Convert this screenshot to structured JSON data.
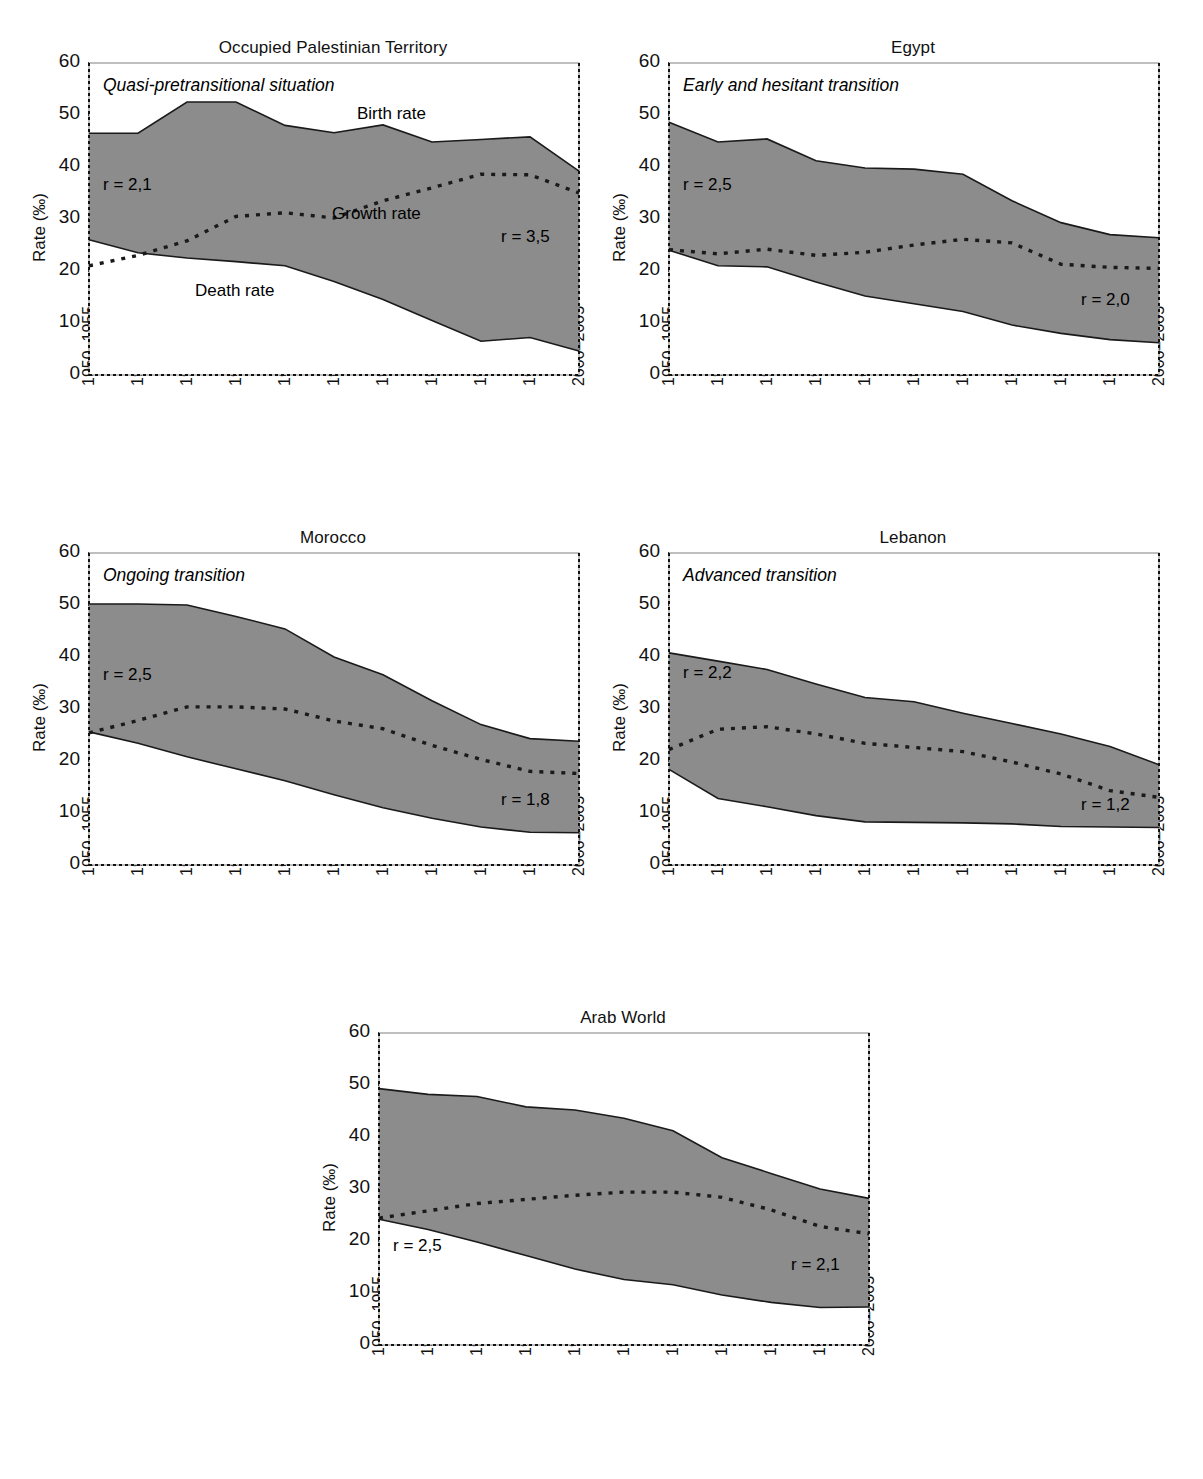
{
  "figure": {
    "y_axis_label": "Rate (‰)",
    "ylim": [
      0,
      60
    ],
    "yticks": [
      0,
      10,
      20,
      30,
      40,
      50,
      60
    ],
    "categories": [
      "1950–1955",
      "1955–1960",
      "1960–1965",
      "1965–1970",
      "1970–1975",
      "1975–1980",
      "1980–1985",
      "1985–1990",
      "1990–1995",
      "1995–2000",
      "2000–2005"
    ],
    "series_labels": {
      "birth": "Birth rate",
      "death": "Death rate",
      "growth": "Growth rate"
    },
    "colors": {
      "band_fill": "#8c8c8c",
      "line": "#1a1a1a",
      "background": "#ffffff"
    }
  },
  "chart_data": [
    {
      "type": "area",
      "title": "Occupied Palestinian Territory",
      "situation": "Quasi-pretransitional situation",
      "xlabel": "",
      "ylabel": "Rate (‰)",
      "ylim": [
        0,
        60
      ],
      "grid": false,
      "legend": "in-plot annotations",
      "categories": [
        "1950–1955",
        "1955–1960",
        "1960–1965",
        "1965–1970",
        "1970–1975",
        "1975–1980",
        "1980–1985",
        "1985–1990",
        "1990–1995",
        "1995–2000",
        "2000–2005"
      ],
      "series": [
        {
          "name": "Birth rate",
          "values": [
            46.5,
            46.5,
            52.5,
            52.5,
            48.0,
            46.6,
            48.1,
            44.8,
            45.3,
            45.8,
            39.2
          ]
        },
        {
          "name": "Death rate",
          "values": [
            26.0,
            23.5,
            22.5,
            21.8,
            21.0,
            18.0,
            14.5,
            10.5,
            6.5,
            7.2,
            4.6
          ]
        },
        {
          "name": "Growth rate",
          "values": [
            21.0,
            23.0,
            25.8,
            30.5,
            31.2,
            30.2,
            33.5,
            36.0,
            38.6,
            38.5,
            35.0
          ]
        }
      ],
      "annotations": [
        {
          "text": "r = 2,1",
          "position": "left"
        },
        {
          "text": "r = 3,5",
          "position": "right"
        },
        {
          "text": "Birth rate",
          "position": "upper-right"
        },
        {
          "text": "Growth rate",
          "position": "center"
        },
        {
          "text": "Death rate",
          "position": "lower-left"
        }
      ],
      "r_left": "r = 2,1",
      "r_right": "r = 3,5"
    },
    {
      "type": "area",
      "title": "Egypt",
      "situation": "Early and hesitant transition",
      "xlabel": "",
      "ylabel": "Rate (‰)",
      "ylim": [
        0,
        60
      ],
      "grid": false,
      "categories": [
        "1950–1955",
        "1955–1960",
        "1960–1965",
        "1965–1970",
        "1970–1975",
        "1975–1980",
        "1980–1985",
        "1985–1990",
        "1990–1995",
        "1995–2000",
        "2000–2005"
      ],
      "series": [
        {
          "name": "Birth rate",
          "values": [
            48.6,
            44.8,
            45.4,
            41.2,
            39.8,
            39.6,
            38.6,
            33.5,
            29.3,
            27.0,
            26.4
          ]
        },
        {
          "name": "Death rate",
          "values": [
            24.0,
            21.0,
            20.8,
            17.9,
            15.2,
            13.7,
            12.2,
            9.6,
            8.0,
            6.8,
            6.2
          ]
        },
        {
          "name": "Growth rate",
          "values": [
            24.1,
            23.3,
            24.2,
            23.0,
            23.6,
            25.0,
            26.1,
            25.4,
            21.3,
            20.7,
            20.5
          ]
        }
      ],
      "annotations": [
        {
          "text": "r = 2,5",
          "position": "left"
        },
        {
          "text": "r = 2,0",
          "position": "right"
        }
      ],
      "r_left": "r = 2,5",
      "r_right": "r = 2,0"
    },
    {
      "type": "area",
      "title": "Morocco",
      "situation": "Ongoing transition",
      "xlabel": "",
      "ylabel": "Rate (‰)",
      "ylim": [
        0,
        60
      ],
      "grid": false,
      "categories": [
        "1950–1955",
        "1955–1960",
        "1960–1965",
        "1965–1970",
        "1970–1975",
        "1975–1980",
        "1980–1985",
        "1985–1990",
        "1990–1995",
        "1995–2000",
        "2000–2005"
      ],
      "series": [
        {
          "name": "Birth rate",
          "values": [
            50.2,
            50.2,
            50.0,
            47.8,
            45.4,
            40.0,
            36.6,
            31.6,
            27.0,
            24.3,
            23.8
          ]
        },
        {
          "name": "Death rate",
          "values": [
            25.6,
            23.4,
            20.8,
            18.5,
            16.2,
            13.5,
            11.0,
            9.0,
            7.3,
            6.3,
            6.2
          ]
        },
        {
          "name": "Growth rate",
          "values": [
            25.4,
            27.8,
            30.4,
            30.4,
            30.0,
            27.7,
            26.2,
            23.0,
            20.3,
            18.0,
            17.6
          ]
        }
      ],
      "annotations": [
        {
          "text": "r = 2,5",
          "position": "left"
        },
        {
          "text": "r = 1,8",
          "position": "right"
        }
      ],
      "r_left": "r = 2,5",
      "r_right": "r = 1,8"
    },
    {
      "type": "area",
      "title": "Lebanon",
      "situation": "Advanced transition",
      "xlabel": "",
      "ylabel": "Rate (‰)",
      "ylim": [
        0,
        60
      ],
      "grid": false,
      "categories": [
        "1950–1955",
        "1955–1960",
        "1960–1965",
        "1965–1970",
        "1970–1975",
        "1975–1980",
        "1980–1985",
        "1985–1990",
        "1990–1995",
        "1995–2000",
        "2000–2005"
      ],
      "series": [
        {
          "name": "Birth rate",
          "values": [
            40.8,
            39.2,
            37.6,
            34.8,
            32.2,
            31.4,
            29.2,
            27.2,
            25.2,
            22.8,
            19.3
          ]
        },
        {
          "name": "Death rate",
          "values": [
            18.4,
            12.8,
            11.2,
            9.5,
            8.3,
            8.2,
            8.1,
            7.9,
            7.4,
            7.3,
            7.2
          ]
        },
        {
          "name": "Growth rate",
          "values": [
            22.2,
            26.1,
            26.6,
            25.2,
            23.4,
            22.6,
            21.8,
            19.8,
            17.5,
            14.3,
            13.0
          ]
        }
      ],
      "annotations": [
        {
          "text": "r = 2,2",
          "position": "left"
        },
        {
          "text": "r = 1,2",
          "position": "right"
        }
      ],
      "r_left": "r = 2,2",
      "r_right": "r = 1,2"
    },
    {
      "type": "area",
      "title": "Arab World",
      "situation": "",
      "xlabel": "",
      "ylabel": "Rate (‰)",
      "ylim": [
        0,
        60
      ],
      "grid": false,
      "categories": [
        "1950–1955",
        "1955–1960",
        "1960–1965",
        "1965–1970",
        "1970–1975",
        "1975–1980",
        "1980–1985",
        "1985–1990",
        "1990–1995",
        "1995–2000",
        "2000–2005"
      ],
      "series": [
        {
          "name": "Birth rate",
          "values": [
            49.3,
            48.2,
            47.8,
            45.8,
            45.2,
            43.6,
            41.2,
            36.0,
            33.0,
            30.0,
            28.2
          ]
        },
        {
          "name": "Death rate",
          "values": [
            24.2,
            22.2,
            19.8,
            17.2,
            14.6,
            12.6,
            11.6,
            9.6,
            8.2,
            7.2,
            7.3
          ]
        },
        {
          "name": "Growth rate",
          "values": [
            24.4,
            25.8,
            27.2,
            28.0,
            28.8,
            29.4,
            29.4,
            28.4,
            26.0,
            22.8,
            21.4
          ]
        }
      ],
      "annotations": [
        {
          "text": "r = 2,5",
          "position": "left"
        },
        {
          "text": "r = 2,1",
          "position": "right"
        }
      ],
      "r_left": "r = 2,5",
      "r_right": "r = 2,1"
    }
  ]
}
